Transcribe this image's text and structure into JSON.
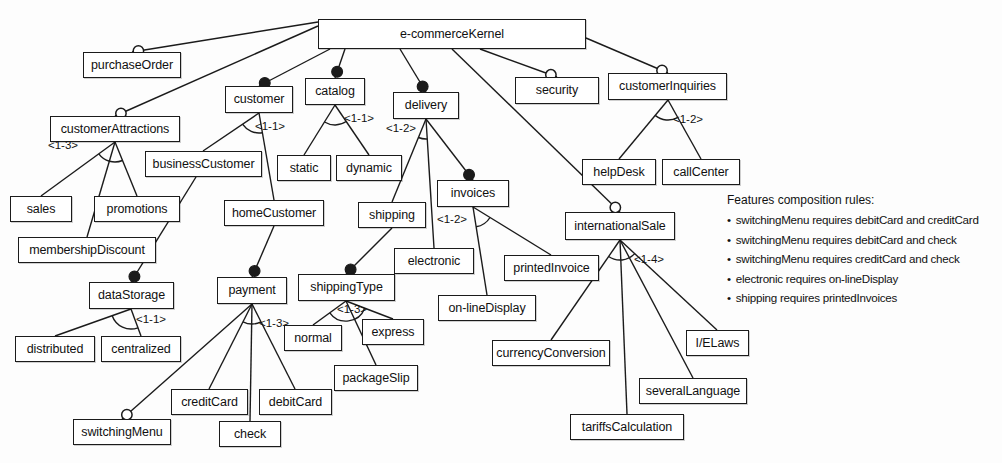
{
  "diagram": {
    "type": "feature-model",
    "stroke_color": "#1b1b1b",
    "fill_color": "#ffffff"
  },
  "nodes": [
    {
      "id": "ecommerceKernel",
      "label": "e-commerceKernel",
      "x": 318,
      "y": 19,
      "w": 268,
      "h": 30
    },
    {
      "id": "purchaseOrder",
      "label": "purchaseOrder",
      "x": 83,
      "y": 52,
      "w": 98,
      "h": 26
    },
    {
      "id": "customerAttractions",
      "label": "customerAttractions",
      "x": 50,
      "y": 116,
      "w": 130,
      "h": 26
    },
    {
      "id": "customer",
      "label": "customer",
      "x": 225,
      "y": 86,
      "w": 68,
      "h": 27
    },
    {
      "id": "catalog",
      "label": "catalog",
      "x": 305,
      "y": 78,
      "w": 60,
      "h": 27
    },
    {
      "id": "delivery",
      "label": "delivery",
      "x": 393,
      "y": 92,
      "w": 66,
      "h": 27
    },
    {
      "id": "security",
      "label": "security",
      "x": 515,
      "y": 77,
      "w": 84,
      "h": 27
    },
    {
      "id": "customerInquiries",
      "label": "customerInquiries",
      "x": 608,
      "y": 73,
      "w": 119,
      "h": 27
    },
    {
      "id": "businessCustomer",
      "label": "businessCustomer",
      "x": 145,
      "y": 151,
      "w": 117,
      "h": 26
    },
    {
      "id": "static",
      "label": "static",
      "x": 277,
      "y": 155,
      "w": 54,
      "h": 26
    },
    {
      "id": "dynamic",
      "label": "dynamic",
      "x": 336,
      "y": 155,
      "w": 66,
      "h": 26
    },
    {
      "id": "helpDesk",
      "label": "helpDesk",
      "x": 582,
      "y": 159,
      "w": 74,
      "h": 26
    },
    {
      "id": "callCenter",
      "label": "callCenter",
      "x": 662,
      "y": 159,
      "w": 78,
      "h": 26
    },
    {
      "id": "sales",
      "label": "sales",
      "x": 10,
      "y": 196,
      "w": 62,
      "h": 26
    },
    {
      "id": "promotions",
      "label": "promotions",
      "x": 94,
      "y": 196,
      "w": 86,
      "h": 26
    },
    {
      "id": "invoices",
      "label": "invoices",
      "x": 437,
      "y": 180,
      "w": 72,
      "h": 27
    },
    {
      "id": "shipping",
      "label": "shipping",
      "x": 358,
      "y": 202,
      "w": 68,
      "h": 26
    },
    {
      "id": "homeCustomer",
      "label": "homeCustomer",
      "x": 224,
      "y": 200,
      "w": 100,
      "h": 26
    },
    {
      "id": "membershipDiscount",
      "label": "membershipDiscount",
      "x": 18,
      "y": 237,
      "w": 138,
      "h": 26
    },
    {
      "id": "internationalSale",
      "label": "internationalSale",
      "x": 565,
      "y": 212,
      "w": 110,
      "h": 28
    },
    {
      "id": "electronic",
      "label": "electronic",
      "x": 394,
      "y": 248,
      "w": 80,
      "h": 26
    },
    {
      "id": "printedInvoice",
      "label": "printedInvoice",
      "x": 504,
      "y": 255,
      "w": 95,
      "h": 26
    },
    {
      "id": "shippingType",
      "label": "shippingType",
      "x": 298,
      "y": 274,
      "w": 97,
      "h": 27
    },
    {
      "id": "dataStorage",
      "label": "dataStorage",
      "x": 89,
      "y": 282,
      "w": 85,
      "h": 27
    },
    {
      "id": "payment",
      "label": "payment",
      "x": 217,
      "y": 277,
      "w": 70,
      "h": 27
    },
    {
      "id": "on-lineDisplay",
      "label": "on-lineDisplay",
      "x": 438,
      "y": 295,
      "w": 98,
      "h": 26
    },
    {
      "id": "normal",
      "label": "normal",
      "x": 284,
      "y": 325,
      "w": 58,
      "h": 26
    },
    {
      "id": "express",
      "label": "express",
      "x": 362,
      "y": 319,
      "w": 62,
      "h": 26
    },
    {
      "id": "distributed",
      "label": "distributed",
      "x": 15,
      "y": 336,
      "w": 80,
      "h": 26
    },
    {
      "id": "centralized",
      "label": "centralized",
      "x": 101,
      "y": 336,
      "w": 80,
      "h": 26
    },
    {
      "id": "I/ELaws",
      "label": "I/ELaws",
      "x": 686,
      "y": 330,
      "w": 63,
      "h": 26
    },
    {
      "id": "currencyConversion",
      "label": "currencyConversion",
      "x": 492,
      "y": 340,
      "w": 118,
      "h": 26
    },
    {
      "id": "packageSlip",
      "label": "packageSlip",
      "x": 334,
      "y": 365,
      "w": 84,
      "h": 26
    },
    {
      "id": "severalLanguage",
      "label": "severalLanguage",
      "x": 639,
      "y": 378,
      "w": 108,
      "h": 26
    },
    {
      "id": "creditCard",
      "label": "creditCard",
      "x": 171,
      "y": 389,
      "w": 77,
      "h": 26
    },
    {
      "id": "debitCard",
      "label": "debitCard",
      "x": 259,
      "y": 389,
      "w": 73,
      "h": 26
    },
    {
      "id": "tariffsCalculation",
      "label": "tariffsCalculation",
      "x": 570,
      "y": 414,
      "w": 114,
      "h": 26
    },
    {
      "id": "switchingMenu",
      "label": "switchingMenu",
      "x": 73,
      "y": 419,
      "w": 98,
      "h": 26
    },
    {
      "id": "check",
      "label": "check",
      "x": 219,
      "y": 421,
      "w": 62,
      "h": 26
    }
  ],
  "cardinalities": [
    {
      "id": "card-customerAttractions",
      "label": "<1-3>",
      "x": 48,
      "y": 139
    },
    {
      "id": "card-customer",
      "label": "<1-1>",
      "x": 255,
      "y": 120
    },
    {
      "id": "card-catalog",
      "label": "<1-1>",
      "x": 344,
      "y": 112
    },
    {
      "id": "card-delivery",
      "label": "<1-2>",
      "x": 386,
      "y": 122
    },
    {
      "id": "card-customerInquiries",
      "label": "<1-2>",
      "x": 673,
      "y": 113
    },
    {
      "id": "card-invoices",
      "label": "<1-2>",
      "x": 437,
      "y": 213
    },
    {
      "id": "card-internationalSale",
      "label": "<1-4>",
      "x": 634,
      "y": 253
    },
    {
      "id": "card-dataStorage",
      "label": "<1-1>",
      "x": 136,
      "y": 313
    },
    {
      "id": "card-payment",
      "label": "<1-3>",
      "x": 259,
      "y": 317
    },
    {
      "id": "card-shippingType",
      "label": "<1-3>",
      "x": 337,
      "y": 303
    }
  ],
  "edges": [
    {
      "from": "ecommerceKernel",
      "to": "purchaseOrder",
      "type": "optional",
      "x1": 318,
      "y1": 22,
      "x2": 132,
      "y2": 52
    },
    {
      "from": "ecommerceKernel",
      "to": "customerAttractions",
      "type": "optional",
      "x1": 318,
      "y1": 26,
      "x2": 115,
      "y2": 116
    },
    {
      "from": "ecommerceKernel",
      "to": "customer",
      "type": "mandatory",
      "x1": 330,
      "y1": 49,
      "x2": 259,
      "y2": 86
    },
    {
      "from": "ecommerceKernel",
      "to": "catalog",
      "type": "mandatory",
      "x1": 345,
      "y1": 49,
      "x2": 335,
      "y2": 78
    },
    {
      "from": "ecommerceKernel",
      "to": "delivery",
      "type": "mandatory",
      "x1": 400,
      "y1": 49,
      "x2": 426,
      "y2": 92
    },
    {
      "from": "ecommerceKernel",
      "to": "security",
      "type": "optional",
      "x1": 480,
      "y1": 49,
      "x2": 557,
      "y2": 77
    },
    {
      "from": "ecommerceKernel",
      "to": "customerInquiries",
      "type": "optional",
      "x1": 586,
      "y1": 38,
      "x2": 668,
      "y2": 73
    },
    {
      "from": "ecommerceKernel",
      "to": "internationalSale",
      "type": "optional",
      "x1": 452,
      "y1": 49,
      "x2": 620,
      "y2": 212
    },
    {
      "from": "customerAttractions",
      "to": "sales",
      "type": "alternative",
      "x1": 115,
      "y1": 142,
      "x2": 41,
      "y2": 196
    },
    {
      "from": "customerAttractions",
      "to": "promotions",
      "type": "alternative",
      "x1": 115,
      "y1": 142,
      "x2": 137,
      "y2": 196
    },
    {
      "from": "customerAttractions",
      "to": "membershipDiscount",
      "type": "alternative",
      "x1": 115,
      "y1": 142,
      "x2": 87,
      "y2": 237
    },
    {
      "from": "customer",
      "to": "businessCustomer",
      "type": "alternative",
      "x1": 259,
      "y1": 113,
      "x2": 203,
      "y2": 151
    },
    {
      "from": "customer",
      "to": "homeCustomer",
      "type": "alternative",
      "x1": 259,
      "y1": 113,
      "x2": 274,
      "y2": 200
    },
    {
      "from": "catalog",
      "to": "static",
      "type": "alternative",
      "x1": 335,
      "y1": 105,
      "x2": 304,
      "y2": 155
    },
    {
      "from": "catalog",
      "to": "dynamic",
      "type": "alternative",
      "x1": 335,
      "y1": 105,
      "x2": 369,
      "y2": 155
    },
    {
      "from": "delivery",
      "to": "shipping",
      "type": "alternative",
      "x1": 426,
      "y1": 119,
      "x2": 392,
      "y2": 202
    },
    {
      "from": "delivery",
      "to": "electronic",
      "type": "alternative",
      "x1": 426,
      "y1": 119,
      "x2": 434,
      "y2": 248
    },
    {
      "from": "delivery",
      "to": "invoices",
      "type": "mandatory",
      "x1": 426,
      "y1": 119,
      "x2": 473,
      "y2": 180
    },
    {
      "from": "customerInquiries",
      "to": "helpDesk",
      "type": "alternative",
      "x1": 668,
      "y1": 100,
      "x2": 619,
      "y2": 159
    },
    {
      "from": "customerInquiries",
      "to": "callCenter",
      "type": "alternative",
      "x1": 668,
      "y1": 100,
      "x2": 701,
      "y2": 159
    },
    {
      "from": "businessCustomer",
      "to": "dataStorage",
      "type": "mandatory",
      "x1": 196,
      "y1": 177,
      "x2": 131,
      "y2": 282
    },
    {
      "from": "homeCustomer",
      "to": "payment",
      "type": "mandatory",
      "x1": 274,
      "y1": 226,
      "x2": 252,
      "y2": 277
    },
    {
      "from": "shipping",
      "to": "shippingType",
      "type": "mandatory",
      "x1": 392,
      "y1": 228,
      "x2": 346,
      "y2": 274
    },
    {
      "from": "invoices",
      "to": "printedInvoice",
      "type": "alternative",
      "x1": 473,
      "y1": 207,
      "x2": 551,
      "y2": 255
    },
    {
      "from": "invoices",
      "to": "on-lineDisplay",
      "type": "alternative",
      "x1": 473,
      "y1": 207,
      "x2": 487,
      "y2": 295
    },
    {
      "from": "dataStorage",
      "to": "distributed",
      "type": "alternative",
      "x1": 131,
      "y1": 309,
      "x2": 55,
      "y2": 336
    },
    {
      "from": "dataStorage",
      "to": "centralized",
      "type": "alternative",
      "x1": 131,
      "y1": 309,
      "x2": 141,
      "y2": 336
    },
    {
      "from": "payment",
      "to": "creditCard",
      "type": "alternative",
      "x1": 252,
      "y1": 304,
      "x2": 209,
      "y2": 389
    },
    {
      "from": "payment",
      "to": "debitCard",
      "type": "alternative",
      "x1": 252,
      "y1": 304,
      "x2": 295,
      "y2": 389
    },
    {
      "from": "payment",
      "to": "check",
      "type": "alternative",
      "x1": 252,
      "y1": 304,
      "x2": 250,
      "y2": 421
    },
    {
      "from": "payment",
      "to": "switchingMenu",
      "type": "optional",
      "x1": 252,
      "y1": 304,
      "x2": 122,
      "y2": 419
    },
    {
      "from": "shippingType",
      "to": "normal",
      "type": "alternative",
      "x1": 346,
      "y1": 301,
      "x2": 313,
      "y2": 325
    },
    {
      "from": "shippingType",
      "to": "express",
      "type": "alternative",
      "x1": 346,
      "y1": 301,
      "x2": 393,
      "y2": 319
    },
    {
      "from": "shippingType",
      "to": "packageSlip",
      "type": "alternative",
      "x1": 346,
      "y1": 301,
      "x2": 376,
      "y2": 365
    },
    {
      "from": "internationalSale",
      "to": "currencyConversion",
      "type": "alternative",
      "x1": 620,
      "y1": 240,
      "x2": 551,
      "y2": 340
    },
    {
      "from": "internationalSale",
      "to": "tariffsCalculation",
      "type": "alternative",
      "x1": 620,
      "y1": 240,
      "x2": 627,
      "y2": 414
    },
    {
      "from": "internationalSale",
      "to": "severalLanguage",
      "type": "alternative",
      "x1": 620,
      "y1": 240,
      "x2": 693,
      "y2": 378
    },
    {
      "from": "internationalSale",
      "to": "I/ELaws",
      "type": "alternative",
      "x1": 620,
      "y1": 240,
      "x2": 717,
      "y2": 330
    }
  ],
  "rules": {
    "title": "Features composition rules:",
    "items": [
      "switchingMenu requires debitCard and creditCard",
      "switchingMenu requires debitCard and check",
      "switchingMenu requires creditCard and check",
      "electronic requires on-lineDisplay",
      "shipping requires printedInvoices"
    ]
  }
}
